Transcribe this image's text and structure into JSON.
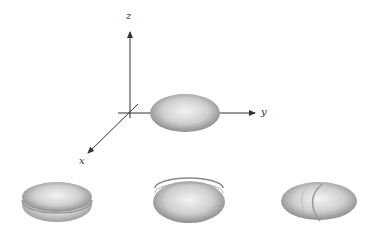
{
  "axes": {
    "x_label": "x",
    "y_label": "y",
    "z_label": "z"
  },
  "colors": {
    "axis": "#333333",
    "shape_dark": "#8a8a8a",
    "shape_light": "#f2f2f2"
  },
  "figure": {
    "main_shape": "ellipsoid",
    "bottom_shapes": [
      "ellipsoid-cut-xy-plane",
      "ellipsoid-cut-xz-plane",
      "ellipsoid-cut-yz-plane"
    ]
  }
}
